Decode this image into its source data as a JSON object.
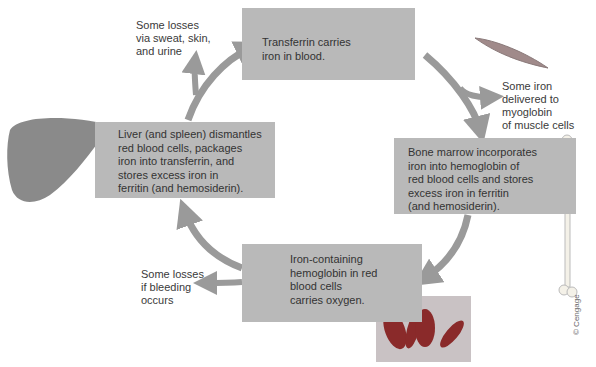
{
  "boxes": {
    "transferrin": "Transferrin carries\niron in blood.",
    "liver": "Liver (and spleen) dismantles\nred blood cells, packages\niron into transferrin, and\nstores excess iron in\nferritin (and hemosiderin).",
    "bone_marrow": "Bone marrow incorporates\niron into hemoglobin of\nred blood cells and stores\nexcess iron in ferritin\n(and hemosiderin).",
    "hemoglobin": "Iron-containing\nhemoglobin in red\nblood cells\ncarries oxygen."
  },
  "labels": {
    "sweat_losses": "Some losses\nvia sweat, skin,\nand urine",
    "myoglobin": "Some iron\ndelivered to\nmyoglobin\nof muscle cells",
    "bleeding_losses": "Some losses\nif bleeding\noccurs"
  },
  "credit": "© Cengage",
  "colors": {
    "box_fill": "#b9b9b9",
    "arrow": "#9a9a9a",
    "liver": "#8a8a8a",
    "text": "#333333"
  }
}
